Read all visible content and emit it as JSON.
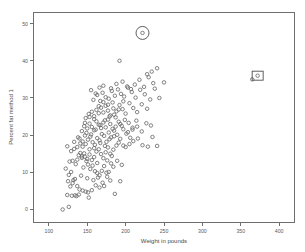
{
  "chart_data": {
    "type": "scatter",
    "title": "",
    "xlabel": "Weight in pounds",
    "ylabel": "Percent fat method 1",
    "xlim": [
      80,
      420
    ],
    "ylim": [
      -3.5,
      53
    ],
    "xticks": [
      100,
      150,
      200,
      250,
      300,
      350,
      400
    ],
    "yticks": [
      0,
      10,
      20,
      30,
      40,
      50
    ],
    "grid": false,
    "legend": null,
    "marker": "open-circle",
    "marker_color": "#6b6b6b",
    "annotations": [
      {
        "type": "circle",
        "label": "circled-outlier",
        "x": 222,
        "y": 47.5
      },
      {
        "type": "rectangle",
        "label": "boxed-outlier",
        "x": 372,
        "y": 36.0
      }
    ],
    "points": [
      [
        118,
        0.0
      ],
      [
        126,
        0.7
      ],
      [
        130,
        3.7
      ],
      [
        134,
        3.8
      ],
      [
        136,
        3.6
      ],
      [
        125,
        7.6
      ],
      [
        131,
        7.1
      ],
      [
        137,
        6.3
      ],
      [
        140,
        5.4
      ],
      [
        144,
        5.1
      ],
      [
        148,
        4.8
      ],
      [
        152,
        3.2
      ],
      [
        156,
        5.2
      ],
      [
        161,
        6.5
      ],
      [
        166,
        5.9
      ],
      [
        172,
        6.3
      ],
      [
        176,
        8.8
      ],
      [
        180,
        7.8
      ],
      [
        186,
        4.2
      ],
      [
        193,
        7.6
      ],
      [
        122,
        11.0
      ],
      [
        127,
        12.9
      ],
      [
        131,
        13.1
      ],
      [
        135,
        12.2
      ],
      [
        139,
        14.6
      ],
      [
        143,
        13.9
      ],
      [
        146,
        15.1
      ],
      [
        149,
        13.0
      ],
      [
        151,
        12.1
      ],
      [
        154,
        10.9
      ],
      [
        157,
        11.8
      ],
      [
        160,
        10.3
      ],
      [
        163,
        9.8
      ],
      [
        166,
        9.2
      ],
      [
        169,
        10.4
      ],
      [
        172,
        11.7
      ],
      [
        175,
        9.9
      ],
      [
        178,
        10.1
      ],
      [
        181,
        12.4
      ],
      [
        184,
        11.5
      ],
      [
        124,
        17.0
      ],
      [
        129,
        15.7
      ],
      [
        133,
        16.3
      ],
      [
        137,
        16.8
      ],
      [
        141,
        15.2
      ],
      [
        144,
        16.9
      ],
      [
        147,
        14.2
      ],
      [
        150,
        13.6
      ],
      [
        153,
        14.8
      ],
      [
        156,
        13.3
      ],
      [
        159,
        14.1
      ],
      [
        162,
        15.6
      ],
      [
        165,
        16.2
      ],
      [
        168,
        14.9
      ],
      [
        171,
        13.8
      ],
      [
        174,
        15.4
      ],
      [
        177,
        16.7
      ],
      [
        180,
        15.0
      ],
      [
        184,
        16.1
      ],
      [
        188,
        17.2
      ],
      [
        140,
        19.1
      ],
      [
        144,
        18.3
      ],
      [
        148,
        17.6
      ],
      [
        151,
        18.8
      ],
      [
        154,
        19.6
      ],
      [
        157,
        18.1
      ],
      [
        160,
        17.4
      ],
      [
        163,
        19.2
      ],
      [
        166,
        18.6
      ],
      [
        169,
        20.3
      ],
      [
        172,
        19.8
      ],
      [
        175,
        18.2
      ],
      [
        178,
        20.7
      ],
      [
        181,
        19.4
      ],
      [
        185,
        21.2
      ],
      [
        189,
        20.1
      ],
      [
        193,
        19.0
      ],
      [
        197,
        21.6
      ],
      [
        201,
        20.4
      ],
      [
        206,
        19.3
      ],
      [
        146,
        22.4
      ],
      [
        150,
        21.8
      ],
      [
        153,
        23.1
      ],
      [
        156,
        22.2
      ],
      [
        159,
        21.3
      ],
      [
        162,
        23.7
      ],
      [
        165,
        22.8
      ],
      [
        168,
        21.9
      ],
      [
        171,
        23.4
      ],
      [
        174,
        22.1
      ],
      [
        177,
        24.2
      ],
      [
        180,
        23.0
      ],
      [
        183,
        21.7
      ],
      [
        187,
        24.8
      ],
      [
        191,
        23.6
      ],
      [
        195,
        22.5
      ],
      [
        199,
        24.1
      ],
      [
        204,
        23.3
      ],
      [
        209,
        22.0
      ],
      [
        214,
        23.9
      ],
      [
        152,
        25.7
      ],
      [
        156,
        26.3
      ],
      [
        159,
        25.1
      ],
      [
        162,
        26.8
      ],
      [
        165,
        25.9
      ],
      [
        168,
        27.4
      ],
      [
        171,
        26.1
      ],
      [
        174,
        27.9
      ],
      [
        177,
        26.6
      ],
      [
        180,
        25.3
      ],
      [
        184,
        27.2
      ],
      [
        188,
        26.4
      ],
      [
        192,
        28.1
      ],
      [
        196,
        27.0
      ],
      [
        200,
        25.8
      ],
      [
        205,
        28.6
      ],
      [
        210,
        27.3
      ],
      [
        215,
        26.2
      ],
      [
        221,
        28.3
      ],
      [
        228,
        27.1
      ],
      [
        158,
        29.5
      ],
      [
        163,
        30.8
      ],
      [
        167,
        29.2
      ],
      [
        170,
        31.4
      ],
      [
        174,
        30.2
      ],
      [
        178,
        29.8
      ],
      [
        182,
        31.9
      ],
      [
        186,
        30.6
      ],
      [
        190,
        32.3
      ],
      [
        194,
        31.1
      ],
      [
        198,
        30.4
      ],
      [
        203,
        32.8
      ],
      [
        208,
        31.6
      ],
      [
        213,
        30.1
      ],
      [
        219,
        32.2
      ],
      [
        225,
        31.0
      ],
      [
        232,
        29.6
      ],
      [
        238,
        32.5
      ],
      [
        244,
        30.0
      ],
      [
        250,
        34.2
      ],
      [
        166,
        32.8
      ],
      [
        171,
        33.3
      ],
      [
        181,
        32.6
      ],
      [
        188,
        33.8
      ],
      [
        196,
        34.4
      ],
      [
        202,
        33.1
      ],
      [
        207,
        32.4
      ],
      [
        212,
        33.6
      ],
      [
        218,
        34.9
      ],
      [
        224,
        33.0
      ],
      [
        230,
        35.6
      ],
      [
        236,
        34.0
      ],
      [
        241,
        38.0
      ],
      [
        228,
        36.4
      ],
      [
        234,
        37.1
      ],
      [
        192,
        40.0
      ],
      [
        155,
        32.1
      ],
      [
        161,
        31.2
      ],
      [
        148,
        24.6
      ],
      [
        143,
        21.1
      ],
      [
        138,
        19.4
      ],
      [
        133,
        18.2
      ],
      [
        129,
        10.1
      ],
      [
        126,
        9.3
      ],
      [
        134,
        8.2
      ],
      [
        142,
        9.1
      ],
      [
        150,
        8.4
      ],
      [
        158,
        7.9
      ],
      [
        164,
        8.6
      ],
      [
        170,
        7.2
      ],
      [
        176,
        13.2
      ],
      [
        182,
        14.4
      ],
      [
        189,
        13.1
      ],
      [
        195,
        12.0
      ],
      [
        200,
        16.8
      ],
      [
        205,
        17.6
      ],
      [
        210,
        18.4
      ],
      [
        216,
        19.1
      ],
      [
        222,
        17.3
      ],
      [
        229,
        16.9
      ],
      [
        235,
        19.5
      ],
      [
        241,
        17.1
      ],
      [
        163,
        12.5
      ],
      [
        167,
        17.9
      ],
      [
        173,
        17.1
      ],
      [
        179,
        18.9
      ],
      [
        185,
        19.7
      ],
      [
        191,
        18.0
      ],
      [
        197,
        17.2
      ],
      [
        203,
        20.8
      ],
      [
        209,
        21.5
      ],
      [
        215,
        22.3
      ],
      [
        221,
        21.0
      ],
      [
        227,
        23.2
      ],
      [
        233,
        22.6
      ],
      [
        145,
        11.3
      ],
      [
        153,
        16.2
      ],
      [
        159,
        16.5
      ],
      [
        143,
        14.3
      ],
      [
        137,
        13.4
      ],
      [
        147,
        19.9
      ],
      [
        141,
        17.8
      ],
      [
        155,
        20.2
      ],
      [
        149,
        20.6
      ],
      [
        161,
        21.5
      ],
      [
        167,
        22.7
      ],
      [
        173,
        24.0
      ],
      [
        179,
        25.0
      ],
      [
        185,
        25.5
      ],
      [
        191,
        26.9
      ],
      [
        197,
        29.1
      ],
      [
        183,
        28.8
      ],
      [
        177,
        28.2
      ],
      [
        171,
        28.9
      ],
      [
        165,
        27.8
      ],
      [
        159,
        24.3
      ],
      [
        153,
        24.9
      ],
      [
        147,
        23.3
      ],
      [
        187,
        22.3
      ],
      [
        193,
        23.0
      ],
      [
        132,
        7.9
      ],
      [
        128,
        6.2
      ],
      [
        124,
        3.9
      ],
      [
        139,
        4.0
      ],
      [
        151,
        4.6
      ],
      [
        365,
        35.0
      ],
      [
        372,
        36.0
      ],
      [
        222,
        47.5
      ]
    ]
  }
}
